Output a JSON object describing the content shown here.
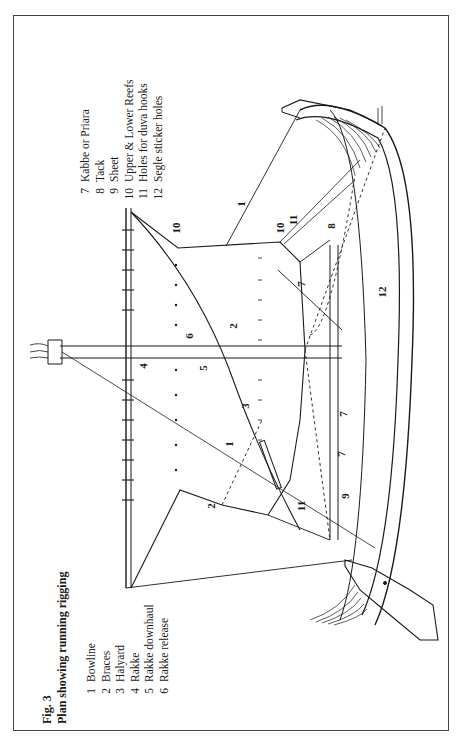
{
  "figure": {
    "number": "Fig. 3",
    "title": "Plan showing running rigging"
  },
  "legend_left": [
    {
      "num": "1",
      "label": "Bowline"
    },
    {
      "num": "2",
      "label": "Braces"
    },
    {
      "num": "3",
      "label": "Halyard"
    },
    {
      "num": "4",
      "label": "Rakke"
    },
    {
      "num": "5",
      "label": "Rakke downhaul"
    },
    {
      "num": "6",
      "label": "Rakke release"
    }
  ],
  "legend_right": [
    {
      "num": "7",
      "label": "Kabbe or Priara"
    },
    {
      "num": "8",
      "label": "Tack"
    },
    {
      "num": "9",
      "label": "Sheet"
    },
    {
      "num": "10",
      "label": "Upper & Lower Reefs"
    },
    {
      "num": "11",
      "label": "Holes for duva hooks"
    },
    {
      "num": "12",
      "label": "Segle sticker holes"
    }
  ],
  "callouts": {
    "c1a": "1",
    "c1b": "1",
    "c1c": "1",
    "c2a": "2",
    "c2b": "2",
    "c3": "3",
    "c4": "4",
    "c5": "5",
    "c6": "6",
    "c7a": "7",
    "c7b": "7",
    "c7c": "7",
    "c8": "8",
    "c9": "9",
    "c10a": "10",
    "c10b": "10",
    "c11a": "11",
    "c11b": "11",
    "c12": "12"
  },
  "artist_signature": "WL BK",
  "colors": {
    "ink": "#1a1a1a",
    "frame": "#444444",
    "paper": "#ffffff"
  }
}
